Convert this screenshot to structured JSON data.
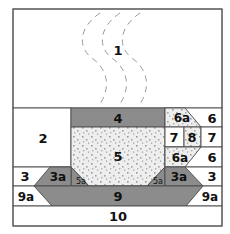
{
  "diagram": {
    "colors": {
      "dark_fabric": "#8c8c8c",
      "light_fabric_base": "#eeeeee",
      "light_fabric_dots": "#9a9a9a",
      "background": "#ffffff",
      "outline": "#555555"
    },
    "pieces": {
      "p1": "1",
      "p2": "2",
      "p3_left": "3",
      "p3_right": "3",
      "p3a_left": "3a",
      "p3a_right": "3a",
      "p4": "4",
      "p5": "5",
      "p5a_left": "5a",
      "p5a_right": "5a",
      "p6_top": "6",
      "p6_bottom": "6",
      "p6a_top": "6a",
      "p6a_bottom": "6a",
      "p7_left": "7",
      "p7_right": "7",
      "p8": "8",
      "p9": "9",
      "p9a_left": "9a",
      "p9a_right": "9a",
      "p10": "10"
    },
    "steam": {
      "description": "three dashed wavy steam lines",
      "count": 3
    }
  }
}
